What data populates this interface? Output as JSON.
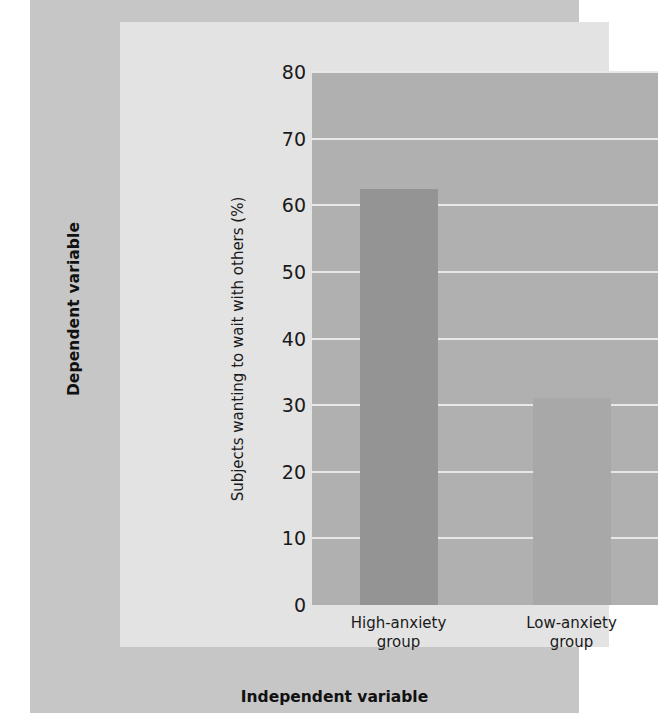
{
  "figure": {
    "outer_label_left": "Dependent variable",
    "outer_label_bottom": "Independent variable",
    "panel_color": "#c6c6c6",
    "inner_panel_color": "#e3e3e3"
  },
  "chart_data": {
    "type": "bar",
    "title": "",
    "xlabel": "Independent variable",
    "ylabel": "Subjects wanting to wait with others (%)",
    "categories": [
      "High-anxiety group",
      "Low-anxiety group"
    ],
    "category_lines": [
      [
        "High-anxiety",
        "group"
      ],
      [
        "Low-anxiety",
        "group"
      ]
    ],
    "values": [
      62.5,
      31
    ],
    "ylim": [
      0,
      80
    ],
    "yticks": [
      0,
      10,
      20,
      30,
      40,
      50,
      60,
      70,
      80
    ],
    "ytick_labels": [
      "0",
      "10",
      "20",
      "30",
      "40",
      "50",
      "60",
      "70",
      "80"
    ],
    "grid": true,
    "legend": "none",
    "bar_colors": [
      "#949494",
      "#a8a8a8"
    ],
    "plot_bg": "#b0b0b0",
    "gridline_color": "#e8e8e8"
  }
}
